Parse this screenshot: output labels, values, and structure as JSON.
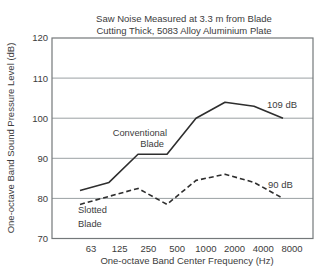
{
  "chart_data": {
    "type": "line",
    "title_line1": "Saw Noise Measured at 3.3 m from Blade",
    "title_line2": "Cutting Thick, 5083 Alloy Aluminium Plate",
    "xlabel": "One-octave Band Center Frequency (Hz)",
    "ylabel": "One-octave Band Sound Pressure Level (dB)",
    "x_tick_labels": [
      "63",
      "125",
      "250",
      "500",
      "1000",
      "2000",
      "4000",
      "8000"
    ],
    "y_tick_labels": [
      120,
      110,
      100,
      90,
      80,
      70
    ],
    "ylim": [
      70,
      120
    ],
    "grid_levels": [
      80,
      90,
      100,
      110
    ],
    "grid_on": true,
    "legend_position": "inline-labels",
    "frequencies_hz": [
      63,
      125,
      250,
      500,
      1000,
      2000,
      4000,
      8000
    ],
    "series": [
      {
        "name": "Conventional Blade",
        "style": "solid",
        "values": [
          82,
          84,
          91,
          91,
          100,
          104,
          103,
          100
        ],
        "label_line1": "Conventional",
        "label_line2": "Blade",
        "annotation": "109 dB"
      },
      {
        "name": "Slotted Blade",
        "style": "dashed",
        "values": [
          78.5,
          80.5,
          82.5,
          78.5,
          84.5,
          86,
          84,
          80
        ],
        "label_line1": "Slotted",
        "label_line2": "Blade",
        "annotation": "90 dB"
      }
    ],
    "colors": {
      "line": "#2e2e2e",
      "grid": "#9aa0a3",
      "frame": "#74787a",
      "text": "#3c3c3c",
      "background": "#ffffff"
    }
  }
}
